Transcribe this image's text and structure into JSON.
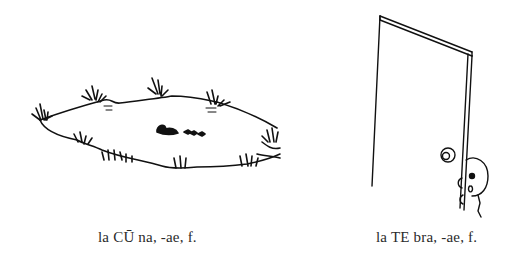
{
  "figures": [
    {
      "id": "lacuna",
      "illustration": "pond-with-ducks-icon",
      "caption": "la CŪ na, -ae, f."
    },
    {
      "id": "latebra",
      "illustration": "girl-hiding-behind-door-icon",
      "caption": "la TE bra, -ae, f."
    }
  ]
}
